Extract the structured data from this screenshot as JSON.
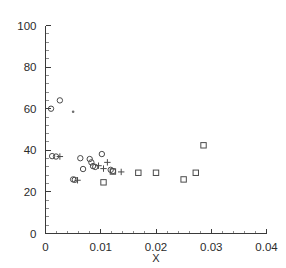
{
  "chart_data": {
    "type": "scatter",
    "title": "",
    "xlabel": "X",
    "ylabel": "",
    "xlim": [
      0,
      0.04
    ],
    "ylim": [
      0,
      100
    ],
    "grid": false,
    "legend": "none",
    "x_ticks": [
      "0",
      "0.01",
      "0.02",
      "0.03",
      "0.04"
    ],
    "x_tick_values": [
      0,
      0.01,
      0.02,
      0.03,
      0.04
    ],
    "x_minor_count": 5,
    "y_ticks": [
      "0",
      "20",
      "40",
      "60",
      "80",
      "100"
    ],
    "y_tick_values": [
      0,
      20,
      40,
      60,
      80,
      100
    ],
    "y_minor_count": 5,
    "series": [
      {
        "name": "circles",
        "marker": "circle",
        "points": [
          [
            0.001,
            60.0
          ],
          [
            0.0026,
            64.0
          ],
          [
            0.0012,
            37.2
          ],
          [
            0.0019,
            37.0
          ],
          [
            0.005,
            26.0
          ],
          [
            0.0053,
            25.8
          ],
          [
            0.0063,
            36.2
          ],
          [
            0.0068,
            31.0
          ],
          [
            0.008,
            35.8
          ],
          [
            0.0083,
            34.2
          ],
          [
            0.0086,
            32.4
          ],
          [
            0.009,
            32.0
          ],
          [
            0.0102,
            38.2
          ],
          [
            0.0118,
            30.6
          ],
          [
            0.0122,
            30.0
          ]
        ]
      },
      {
        "name": "plus-marks",
        "marker": "plus",
        "points": [
          [
            0.0026,
            37.0
          ],
          [
            0.0058,
            25.6
          ],
          [
            0.0096,
            32.6
          ],
          [
            0.0105,
            31.2
          ],
          [
            0.0112,
            34.2
          ],
          [
            0.0137,
            29.6
          ]
        ]
      },
      {
        "name": "squares",
        "marker": "square",
        "points": [
          [
            0.0105,
            24.6
          ],
          [
            0.0122,
            29.8
          ],
          [
            0.0168,
            29.2
          ],
          [
            0.02,
            29.2
          ],
          [
            0.025,
            26.0
          ],
          [
            0.0272,
            29.2
          ],
          [
            0.0286,
            42.4
          ]
        ]
      },
      {
        "name": "small-dots",
        "marker": "dot",
        "points": [
          [
            0.005,
            58.5
          ]
        ]
      }
    ]
  },
  "colors": {
    "background": "#ffffff",
    "axis": "#3a3a3a",
    "marker": "#4a4a4a",
    "minor_tick": "#8c8c8c",
    "text": "#2b2b2b"
  }
}
